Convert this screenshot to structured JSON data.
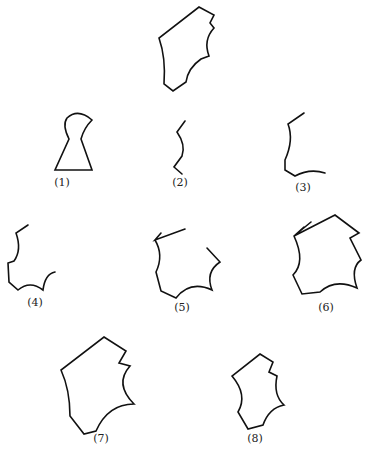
{
  "diagram": {
    "type": "shape-assembly-puzzle",
    "target": {
      "name": "target-shape",
      "label": ""
    },
    "options": [
      {
        "id": 1,
        "label": "(1)",
        "description": "keyhole shape"
      },
      {
        "id": 2,
        "label": "(2)",
        "description": "short curved segment"
      },
      {
        "id": 3,
        "label": "(3)",
        "description": "open curved edge"
      },
      {
        "id": 4,
        "label": "(4)",
        "description": "open jagged edge with concave arc"
      },
      {
        "id": 5,
        "label": "(5)",
        "description": "open polygon with concave arcs"
      },
      {
        "id": 6,
        "label": "(6)",
        "description": "polygon with overlapping start line"
      },
      {
        "id": 7,
        "label": "(7)",
        "description": "closed polygon with concave arcs"
      },
      {
        "id": 8,
        "label": "(8)",
        "description": "closed narrow polygon with concave arcs"
      }
    ],
    "stroke_color": "#111111",
    "background_color": "#ffffff"
  }
}
